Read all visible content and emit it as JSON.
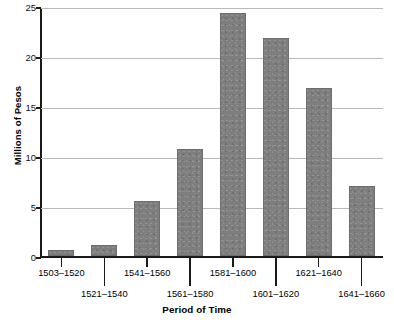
{
  "chart_data": {
    "type": "bar",
    "title": "",
    "xlabel": "Period of Time",
    "ylabel": "Millions of Pesos",
    "categories": [
      "1503–1520",
      "1521–1540",
      "1541–1560",
      "1561–1580",
      "1581–1600",
      "1601–1620",
      "1621–1640",
      "1641–1660"
    ],
    "values": [
      0.6,
      1.2,
      5.6,
      10.8,
      24.5,
      22.0,
      17.0,
      7.1
    ],
    "ylim": [
      0,
      25
    ],
    "yticks": [
      0,
      5,
      10,
      15,
      20,
      25
    ],
    "ytick_labels": [
      "0",
      "5",
      "10",
      "15",
      "20",
      "25"
    ],
    "xlim": [
      0,
      8
    ],
    "grid": "horizontal",
    "legend": "none",
    "bar_color": "#7e7e7e",
    "bar_edge_color": "#6e6e6e",
    "gridline_color": "#b9b9b9",
    "axis_color": "#1a1a1a",
    "background_color": "#ffffff",
    "xlabel_rows": [
      0,
      1,
      0,
      1,
      0,
      1,
      0,
      1
    ]
  }
}
